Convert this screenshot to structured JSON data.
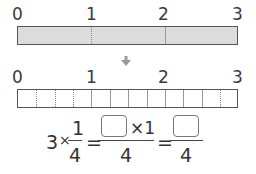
{
  "top_bar": {
    "labels": [
      "0",
      "1",
      "2",
      "3"
    ],
    "fill_color": "#dcdcdc",
    "divisions": 3
  },
  "arrow": {
    "icon": "down-arrow-icon"
  },
  "bottom_bar": {
    "labels": [
      "0",
      "1",
      "2",
      "3"
    ],
    "divisions": 12
  },
  "equation": {
    "lhs_whole": "3",
    "times": "×",
    "frac1_num": "1",
    "frac1_den": "4",
    "equals": "=",
    "frac2_times_one": "×1",
    "frac2_den": "4",
    "frac3_den": "4"
  }
}
